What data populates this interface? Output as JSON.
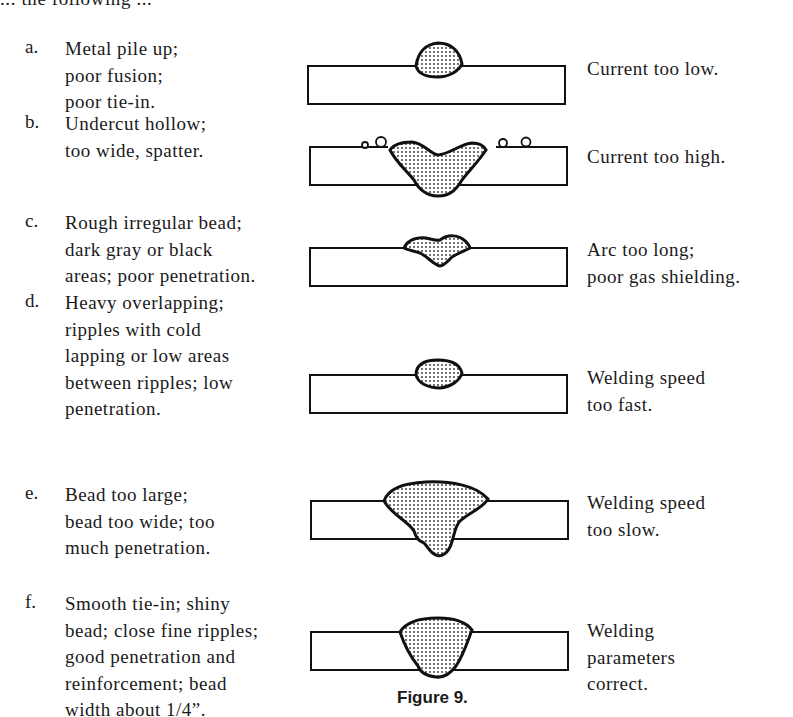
{
  "intro_text": "... the following ...",
  "items": [
    {
      "letter": "a.",
      "description": "Metal pile up;\npoor fusion;\npoor tie-in.",
      "cause": "Current too low."
    },
    {
      "letter": "b.",
      "description": "Undercut hollow;\ntoo wide, spatter.",
      "cause": "Current too high."
    },
    {
      "letter": "c.",
      "description": "Rough irregular bead;\ndark gray or black\nareas; poor penetration.",
      "cause": "Arc too long;\npoor gas shielding."
    },
    {
      "letter": "d.",
      "description": "Heavy overlapping;\nripples with cold\nlapping or low areas\nbetween ripples; low\npenetration.",
      "cause": "Welding speed\ntoo fast."
    },
    {
      "letter": "e.",
      "description": "Bead too large;\nbead too wide; too\nmuch penetration.",
      "cause": "Welding speed\ntoo slow."
    },
    {
      "letter": "f.",
      "description": "Smooth tie-in; shiny\nbead; close fine ripples;\ngood penetration and\nreinforcement; bead\nwidth about 1/4”.",
      "cause": "Welding\nparameters\ncorrect."
    }
  ],
  "figure_caption": "Figure 9."
}
